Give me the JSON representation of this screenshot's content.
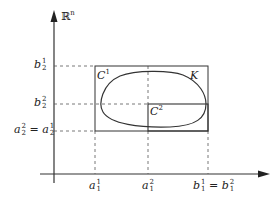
{
  "diagram": {
    "space_label": {
      "base": "ℝ",
      "sup": "n"
    },
    "set_label": "K",
    "boxes": [
      {
        "name": "C",
        "sup": "1"
      },
      {
        "name": "C",
        "sup": "2"
      }
    ],
    "y_labels": [
      {
        "base": "b",
        "sup": "1",
        "sub": "2"
      },
      {
        "base": "b",
        "sup": "2",
        "sub": "2"
      },
      {
        "left": {
          "base": "a",
          "sup": "2",
          "sub": "2"
        },
        "eq": "=",
        "right": {
          "base": "a",
          "sup": "1",
          "sub": "2"
        }
      }
    ],
    "x_labels": [
      {
        "base": "a",
        "sup": "1",
        "sub": "1"
      },
      {
        "base": "a",
        "sup": "2",
        "sub": "1"
      },
      {
        "left": {
          "base": "b",
          "sup": "1",
          "sub": "1"
        },
        "eq": "=",
        "right": {
          "base": "b",
          "sup": "2",
          "sub": "1"
        }
      }
    ],
    "colors": {
      "stroke": "#333333",
      "dashed": "#555555"
    }
  }
}
